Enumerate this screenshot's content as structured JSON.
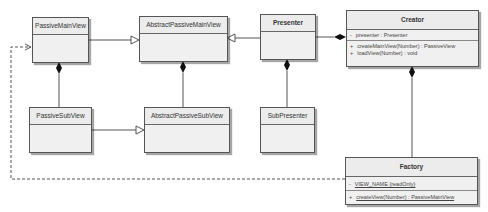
{
  "classes": {
    "passive_main_view": {
      "name": "PassiveMainView"
    },
    "abstract_passive_main_view": {
      "name": "AbstractPassiveMainView"
    },
    "presenter": {
      "name": "Presenter"
    },
    "creator": {
      "name": "Creator",
      "attributes": [
        {
          "vis": "-",
          "text": "presenter : Presenter"
        }
      ],
      "operations": [
        {
          "vis": "+",
          "text": "createMainView(Number) : PassiveView"
        },
        {
          "vis": "+",
          "text": "loadView(Number) : void"
        }
      ]
    },
    "passive_sub_view": {
      "name": "PassiveSubView"
    },
    "abstract_passive_sub_view": {
      "name": "AbstractPassiveSubView"
    },
    "sub_presenter": {
      "name": "SubPresenter"
    },
    "factory": {
      "name": "Factory",
      "attributes": [
        {
          "vis": "-",
          "text": "VIEW_NAME {readOnly}"
        }
      ],
      "operations": [
        {
          "vis": "+",
          "text": "createView(Number) : PassiveMainView"
        }
      ]
    }
  },
  "relationships": [
    {
      "type": "generalization",
      "from": "PassiveMainView",
      "to": "AbstractPassiveMainView"
    },
    {
      "type": "generalization",
      "from": "Presenter",
      "to": "AbstractPassiveMainView"
    },
    {
      "type": "composition",
      "whole": "Creator",
      "part": "Presenter"
    },
    {
      "type": "composition",
      "whole": "PassiveMainView",
      "part": "PassiveSubView"
    },
    {
      "type": "composition",
      "whole": "AbstractPassiveMainView",
      "part": "AbstractPassiveSubView"
    },
    {
      "type": "composition",
      "whole": "Presenter",
      "part": "SubPresenter"
    },
    {
      "type": "composition",
      "whole": "Creator",
      "part": "Factory"
    },
    {
      "type": "generalization",
      "from": "PassiveSubView",
      "to": "AbstractPassiveSubView"
    },
    {
      "type": "dependency",
      "from": "Factory",
      "to": "PassiveMainView"
    }
  ]
}
